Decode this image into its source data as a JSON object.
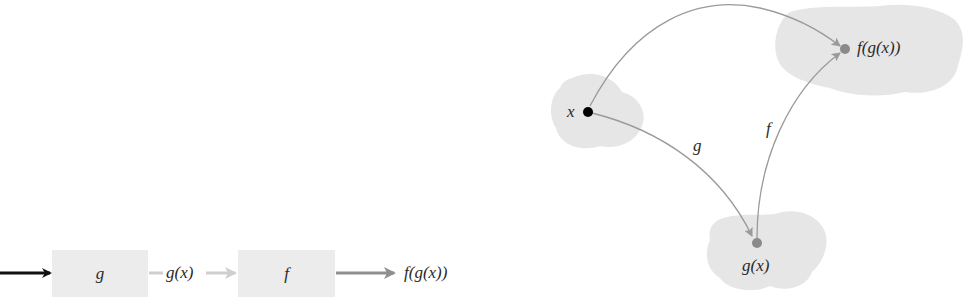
{
  "pipeline": {
    "input_arrow_color": "#111111",
    "boxes": [
      {
        "label": "g"
      },
      {
        "label": "f"
      }
    ],
    "intermediate_label": "g(x)",
    "output_label": "f(g(x))",
    "intermediate_arrow_color": "#cfcfcf",
    "output_arrow_color": "#8f8f8f",
    "box_fill": "#ececec"
  },
  "mapping_diagram": {
    "points": [
      {
        "label": "x",
        "dot_color": "#000000"
      },
      {
        "label": "g(x)",
        "dot_color": "#8a8a8a"
      },
      {
        "label": "f(g(x))",
        "dot_color": "#8a8a8a"
      }
    ],
    "arrows": [
      {
        "from": "x",
        "to": "g(x)",
        "label": "g"
      },
      {
        "from": "g(x)",
        "to": "f(g(x))",
        "label": "f"
      },
      {
        "from": "x",
        "to": "f(g(x))",
        "label": ""
      }
    ],
    "blob_fill": "#e6e6e6",
    "arrow_color": "#9a9a9a"
  }
}
